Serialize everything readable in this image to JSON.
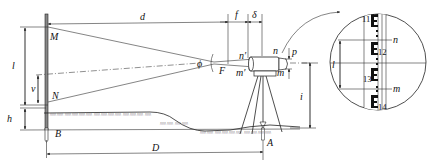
{
  "diagram": {
    "type": "stadia-distance-measurement",
    "labels": {
      "d": "d",
      "f": "f",
      "delta": "δ",
      "M": "M",
      "N": "N",
      "l_left": "l",
      "v": "v",
      "h": "h",
      "B": "B",
      "phi": "ϕ",
      "F": "F",
      "n_prime": "n′",
      "m_prime": "m′",
      "n": "n",
      "m": "m",
      "p": "p",
      "i": "i",
      "D": "D",
      "A": "A"
    },
    "inset": {
      "staff_numbers": [
        "11",
        "12",
        "13",
        "14"
      ],
      "n": "n",
      "m": "m",
      "l": "l"
    }
  }
}
